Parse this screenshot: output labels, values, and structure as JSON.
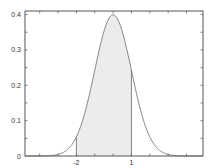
{
  "chart_data": {
    "type": "area",
    "title": "",
    "xlabel": "",
    "ylabel": "",
    "xlim": [
      -4.8,
      4.9
    ],
    "ylim": [
      0,
      0.41
    ],
    "grid": false,
    "legend": null,
    "curve": {
      "name": "N(0,1) pdf",
      "mean": 0,
      "std": 1,
      "peak": 0.3989
    },
    "shaded_region": {
      "from": -2,
      "to": 1,
      "fill": "#ececec"
    },
    "x_tick_labels": [
      {
        "value": -2,
        "label": "-2"
      },
      {
        "value": 1,
        "label": "1"
      }
    ],
    "y_tick_labels": [
      {
        "value": 0,
        "label": "0"
      },
      {
        "value": 0.1,
        "label": "0.1"
      },
      {
        "value": 0.2,
        "label": "0.2"
      },
      {
        "value": 0.3,
        "label": "0.3"
      },
      {
        "value": 0.4,
        "label": "0.4"
      }
    ],
    "colors": {
      "axis": "#555555",
      "curve": "#777777",
      "fill": "#ececec",
      "boundary": "#666666"
    }
  }
}
